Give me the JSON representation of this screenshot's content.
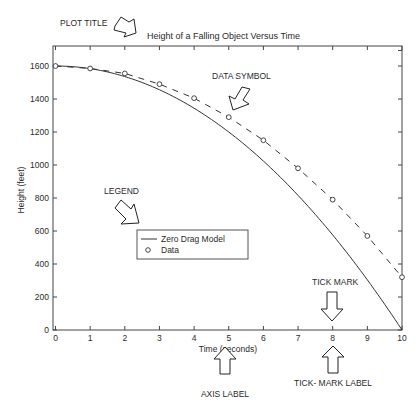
{
  "chart_data": {
    "type": "line",
    "title": "Height of a Falling Object Versus Time",
    "xlabel": "Time (seconds)",
    "ylabel": "Height (feet)",
    "xlim": [
      0,
      10
    ],
    "ylim": [
      0,
      1700
    ],
    "x_ticks": [
      0,
      1,
      2,
      3,
      4,
      5,
      6,
      7,
      8,
      9,
      10
    ],
    "y_ticks": [
      0,
      200,
      400,
      600,
      800,
      1000,
      1200,
      1400,
      1600
    ],
    "grid": false,
    "legend_position": "inside, center-left",
    "x": [
      0,
      1,
      2,
      3,
      4,
      5,
      6,
      7,
      8,
      9,
      10
    ],
    "series": [
      {
        "name": "Zero Drag Model",
        "style": "solid line",
        "values": [
          1600,
          1584,
          1536,
          1456,
          1344,
          1200,
          1024,
          816,
          576,
          304,
          0
        ]
      },
      {
        "name": "Data",
        "style": "circle markers with dashed line",
        "values": [
          1600,
          1585,
          1555,
          1490,
          1405,
          1290,
          1150,
          980,
          790,
          570,
          320
        ]
      }
    ],
    "legend": [
      "Zero Drag Model",
      "Data"
    ],
    "annotations": [
      "PLOT TITLE",
      "DATA SYMBOL",
      "LEGEND",
      "TICK MARK",
      "AXIS LABEL",
      "TICK- MARK LABEL"
    ]
  },
  "title": "Height of a Falling Object Versus Time",
  "axes": {
    "xlabel": "Time (seconds)",
    "ylabel": "Height (feet)",
    "x_tick_labels": [
      "0",
      "1",
      "2",
      "3",
      "4",
      "5",
      "6",
      "7",
      "8",
      "9",
      "10"
    ],
    "y_tick_labels": [
      "0",
      "200",
      "400",
      "600",
      "800",
      "1000",
      "1200",
      "1400",
      "1600"
    ]
  },
  "legend": {
    "model_label": "Zero Drag Model",
    "data_label": "Data"
  },
  "callouts": {
    "plot_title": "PLOT TITLE",
    "data_symbol": "DATA SYMBOL",
    "legend": "LEGEND",
    "tick_mark": "TICK MARK",
    "axis_label": "AXIS LABEL",
    "tick_mark_label": "TICK- MARK LABEL"
  }
}
